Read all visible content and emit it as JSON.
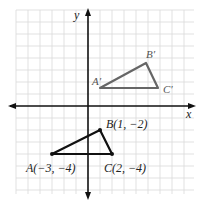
{
  "axes": {
    "x_label": "x",
    "y_label": "y"
  },
  "original": {
    "A": {
      "label": "A(−3, −4)",
      "x": -3,
      "y": -4
    },
    "B": {
      "label": "B(1, −2)",
      "x": 1,
      "y": -2
    },
    "C": {
      "label": "C(2, −4)",
      "x": 2,
      "y": -4
    }
  },
  "image": {
    "A": {
      "label": "A′"
    },
    "B": {
      "label": "B′"
    },
    "C": {
      "label": "C′"
    }
  },
  "colors": {
    "original": "#111111",
    "image": "#666666",
    "grid": "#d8d8d8"
  }
}
